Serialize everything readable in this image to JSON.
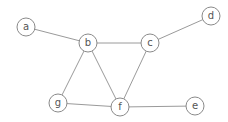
{
  "graph": {
    "nodes": [
      {
        "id": "a",
        "label": "a"
      },
      {
        "id": "b",
        "label": "b"
      },
      {
        "id": "c",
        "label": "c"
      },
      {
        "id": "d",
        "label": "d"
      },
      {
        "id": "e",
        "label": "e"
      },
      {
        "id": "f",
        "label": "f"
      },
      {
        "id": "g",
        "label": "g"
      }
    ],
    "edges": [
      {
        "from": "a",
        "to": "b"
      },
      {
        "from": "b",
        "to": "c"
      },
      {
        "from": "c",
        "to": "d"
      },
      {
        "from": "b",
        "to": "g"
      },
      {
        "from": "b",
        "to": "f"
      },
      {
        "from": "c",
        "to": "f"
      },
      {
        "from": "g",
        "to": "f"
      },
      {
        "from": "f",
        "to": "e"
      }
    ],
    "colors": {
      "edge": "#9a9a9a",
      "node_stroke": "#8a8a8a",
      "label": "#555555"
    }
  }
}
